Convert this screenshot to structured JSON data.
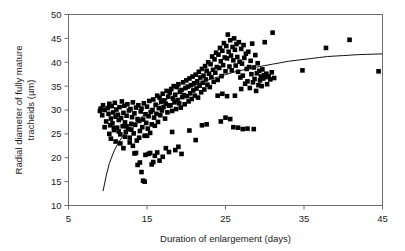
{
  "chart_data": {
    "type": "scatter",
    "title": "",
    "xlabel": "Duration of enlargement (days)",
    "ylabel": "Radial diameter of fully mature tracheids (µm)",
    "ylabel_line1": "Radial diameter of fully mature",
    "ylabel_line2": "tracheids (µm)",
    "xlim": [
      5,
      45
    ],
    "ylim": [
      10,
      50
    ],
    "xticks": [
      5,
      15,
      25,
      35,
      45
    ],
    "yticks": [
      10,
      15,
      20,
      25,
      30,
      35,
      40,
      45,
      50
    ],
    "xtick_labels": [
      "5",
      "15",
      "25",
      "35",
      "45"
    ],
    "ytick_labels": [
      "10",
      "15",
      "20",
      "25",
      "30",
      "35",
      "40",
      "45",
      "50"
    ],
    "grid": false,
    "legend": false,
    "marker": "filled-square",
    "marker_color": "#000000",
    "marker_size_px": 4.6,
    "series": [
      {
        "name": "tracheid measurements",
        "points": [
          [
            9.0,
            29.8
          ],
          [
            9.1,
            30.3
          ],
          [
            9.3,
            28.9
          ],
          [
            9.4,
            31.0
          ],
          [
            9.6,
            30.0
          ],
          [
            9.8,
            27.6
          ],
          [
            10.0,
            30.4
          ],
          [
            10.1,
            29.2
          ],
          [
            10.2,
            31.3
          ],
          [
            10.3,
            26.8
          ],
          [
            10.4,
            28.2
          ],
          [
            10.5,
            30.8
          ],
          [
            10.6,
            27.2
          ],
          [
            10.7,
            29.5
          ],
          [
            10.8,
            25.8
          ],
          [
            10.9,
            31.5
          ],
          [
            11.0,
            28.6
          ],
          [
            11.1,
            30.1
          ],
          [
            11.2,
            26.3
          ],
          [
            11.3,
            29.0
          ],
          [
            11.4,
            27.9
          ],
          [
            11.5,
            30.6
          ],
          [
            11.6,
            24.9
          ],
          [
            11.7,
            28.3
          ],
          [
            11.8,
            31.8
          ],
          [
            11.9,
            26.6
          ],
          [
            12.0,
            29.4
          ],
          [
            12.1,
            30.9
          ],
          [
            12.2,
            27.4
          ],
          [
            12.3,
            25.4
          ],
          [
            12.4,
            28.8
          ],
          [
            12.5,
            31.2
          ],
          [
            12.6,
            26.0
          ],
          [
            12.7,
            29.9
          ],
          [
            12.8,
            24.2
          ],
          [
            12.9,
            30.2
          ],
          [
            13.0,
            27.1
          ],
          [
            13.1,
            28.5
          ],
          [
            13.2,
            31.6
          ],
          [
            13.3,
            25.1
          ],
          [
            13.4,
            29.3
          ],
          [
            13.5,
            26.9
          ],
          [
            13.6,
            30.5
          ],
          [
            13.7,
            23.6
          ],
          [
            13.8,
            28.1
          ],
          [
            13.9,
            31.0
          ],
          [
            14.0,
            27.7
          ],
          [
            14.1,
            25.6
          ],
          [
            14.2,
            29.7
          ],
          [
            14.3,
            30.3
          ],
          [
            14.4,
            26.4
          ],
          [
            14.5,
            28.0
          ],
          [
            14.6,
            31.4
          ],
          [
            14.7,
            24.6
          ],
          [
            14.8,
            29.1
          ],
          [
            14.9,
            27.3
          ],
          [
            15.0,
            30.7
          ],
          [
            15.1,
            26.1
          ],
          [
            15.2,
            28.7
          ],
          [
            15.3,
            31.9
          ],
          [
            15.4,
            25.2
          ],
          [
            15.5,
            29.6
          ],
          [
            15.6,
            27.0
          ],
          [
            15.7,
            30.0
          ],
          [
            15.8,
            32.2
          ],
          [
            15.9,
            28.4
          ],
          [
            16.0,
            26.7
          ],
          [
            16.1,
            31.1
          ],
          [
            16.2,
            29.2
          ],
          [
            16.3,
            33.0
          ],
          [
            16.4,
            27.5
          ],
          [
            16.5,
            30.4
          ],
          [
            16.6,
            32.6
          ],
          [
            16.7,
            28.9
          ],
          [
            16.8,
            31.7
          ],
          [
            16.9,
            29.9
          ],
          [
            17.0,
            33.4
          ],
          [
            17.1,
            30.6
          ],
          [
            17.2,
            32.0
          ],
          [
            17.3,
            28.2
          ],
          [
            17.4,
            31.3
          ],
          [
            17.5,
            34.0
          ],
          [
            17.6,
            29.5
          ],
          [
            17.7,
            32.8
          ],
          [
            17.8,
            30.9
          ],
          [
            17.9,
            33.6
          ],
          [
            18.0,
            31.0
          ],
          [
            18.1,
            34.4
          ],
          [
            18.2,
            29.8
          ],
          [
            18.3,
            32.4
          ],
          [
            18.4,
            35.0
          ],
          [
            18.5,
            31.6
          ],
          [
            18.6,
            33.2
          ],
          [
            18.7,
            30.2
          ],
          [
            18.8,
            34.8
          ],
          [
            18.9,
            32.1
          ],
          [
            19.0,
            35.4
          ],
          [
            19.1,
            31.4
          ],
          [
            19.2,
            33.8
          ],
          [
            19.3,
            30.5
          ],
          [
            19.4,
            34.2
          ],
          [
            19.5,
            32.7
          ],
          [
            19.6,
            35.8
          ],
          [
            19.7,
            33.1
          ],
          [
            19.8,
            31.2
          ],
          [
            19.9,
            34.6
          ],
          [
            20.0,
            36.2
          ],
          [
            20.1,
            32.9
          ],
          [
            20.2,
            34.9
          ],
          [
            20.3,
            31.8
          ],
          [
            20.4,
            36.6
          ],
          [
            20.5,
            33.5
          ],
          [
            20.6,
            35.2
          ],
          [
            20.7,
            32.3
          ],
          [
            20.8,
            37.0
          ],
          [
            20.9,
            34.1
          ],
          [
            21.0,
            35.6
          ],
          [
            21.1,
            33.0
          ],
          [
            21.2,
            37.4
          ],
          [
            21.3,
            34.5
          ],
          [
            21.4,
            36.0
          ],
          [
            21.5,
            32.6
          ],
          [
            21.6,
            38.0
          ],
          [
            21.7,
            35.1
          ],
          [
            21.8,
            36.8
          ],
          [
            21.9,
            33.7
          ],
          [
            22.0,
            38.6
          ],
          [
            22.1,
            35.7
          ],
          [
            22.2,
            37.2
          ],
          [
            22.3,
            34.3
          ],
          [
            22.4,
            39.2
          ],
          [
            22.5,
            36.4
          ],
          [
            22.6,
            38.2
          ],
          [
            22.7,
            35.3
          ],
          [
            22.8,
            40.0
          ],
          [
            22.9,
            37.6
          ],
          [
            23.0,
            34.8
          ],
          [
            23.1,
            39.6
          ],
          [
            23.2,
            36.9
          ],
          [
            23.3,
            41.2
          ],
          [
            23.4,
            38.4
          ],
          [
            23.5,
            35.9
          ],
          [
            23.6,
            40.6
          ],
          [
            23.7,
            37.8
          ],
          [
            23.8,
            42.0
          ],
          [
            23.9,
            39.0
          ],
          [
            24.0,
            36.3
          ],
          [
            24.1,
            41.6
          ],
          [
            24.2,
            38.8
          ],
          [
            24.3,
            43.0
          ],
          [
            24.4,
            40.2
          ],
          [
            24.5,
            37.1
          ],
          [
            24.6,
            42.4
          ],
          [
            24.7,
            39.4
          ],
          [
            24.8,
            44.0
          ],
          [
            24.9,
            41.0
          ],
          [
            25.0,
            38.1
          ],
          [
            25.1,
            43.4
          ],
          [
            25.2,
            40.8
          ],
          [
            25.3,
            45.8
          ],
          [
            25.4,
            42.2
          ],
          [
            25.5,
            39.1
          ],
          [
            25.6,
            44.6
          ],
          [
            25.7,
            41.4
          ],
          [
            25.8,
            38.3
          ],
          [
            25.9,
            43.2
          ],
          [
            26.0,
            40.4
          ],
          [
            26.1,
            45.0
          ],
          [
            26.2,
            42.6
          ],
          [
            26.3,
            39.3
          ],
          [
            26.4,
            43.8
          ],
          [
            26.5,
            41.1
          ],
          [
            26.6,
            38.0
          ],
          [
            26.7,
            44.2
          ],
          [
            26.8,
            40.1
          ],
          [
            26.9,
            36.8
          ],
          [
            27.0,
            42.8
          ],
          [
            27.1,
            39.7
          ],
          [
            27.2,
            37.2
          ],
          [
            27.3,
            43.6
          ],
          [
            27.4,
            40.9
          ],
          [
            27.5,
            35.5
          ],
          [
            27.6,
            41.8
          ],
          [
            27.7,
            38.6
          ],
          [
            27.8,
            36.0
          ],
          [
            27.9,
            42.2
          ],
          [
            28.0,
            39.0
          ],
          [
            28.1,
            34.6
          ],
          [
            28.2,
            40.3
          ],
          [
            28.3,
            37.5
          ],
          [
            28.4,
            43.9
          ],
          [
            28.5,
            35.8
          ],
          [
            28.6,
            38.9
          ],
          [
            28.7,
            36.5
          ],
          [
            28.8,
            41.5
          ],
          [
            28.9,
            34.0
          ],
          [
            29.0,
            37.7
          ],
          [
            29.1,
            39.8
          ],
          [
            29.2,
            35.2
          ],
          [
            29.3,
            38.2
          ],
          [
            29.4,
            36.2
          ],
          [
            29.5,
            37.0
          ],
          [
            29.6,
            35.0
          ],
          [
            29.7,
            38.5
          ],
          [
            29.8,
            36.6
          ],
          [
            29.9,
            37.3
          ],
          [
            30.0,
            44.2
          ],
          [
            30.1,
            36.9
          ],
          [
            30.2,
            37.6
          ],
          [
            30.3,
            35.4
          ],
          [
            30.5,
            37.1
          ],
          [
            30.7,
            36.4
          ],
          [
            30.9,
            37.9
          ],
          [
            31.0,
            46.2
          ],
          [
            31.2,
            36.7
          ],
          [
            12.0,
            22.0
          ],
          [
            13.2,
            22.5
          ],
          [
            13.4,
            20.9
          ],
          [
            13.6,
            21.0
          ],
          [
            13.8,
            18.5
          ],
          [
            14.0,
            24.2
          ],
          [
            14.1,
            19.0
          ],
          [
            14.3,
            17.0
          ],
          [
            14.5,
            15.2
          ],
          [
            14.7,
            15.0
          ],
          [
            14.8,
            20.6
          ],
          [
            15.0,
            24.6
          ],
          [
            15.2,
            20.8
          ],
          [
            15.4,
            21.0
          ],
          [
            15.6,
            18.6
          ],
          [
            15.8,
            19.1
          ],
          [
            16.0,
            20.4
          ],
          [
            16.3,
            21.1
          ],
          [
            16.6,
            19.4
          ],
          [
            17.0,
            20.2
          ],
          [
            17.4,
            22.0
          ],
          [
            17.8,
            21.2
          ],
          [
            18.2,
            25.4
          ],
          [
            18.6,
            21.6
          ],
          [
            19.0,
            22.3
          ],
          [
            19.4,
            20.8
          ],
          [
            20.4,
            25.7
          ],
          [
            21.2,
            23.7
          ],
          [
            22.0,
            26.8
          ],
          [
            22.6,
            27.0
          ],
          [
            24.4,
            27.6
          ],
          [
            25.0,
            28.4
          ],
          [
            25.6,
            28.1
          ],
          [
            26.0,
            26.4
          ],
          [
            26.6,
            26.3
          ],
          [
            27.2,
            26.0
          ],
          [
            27.8,
            26.1
          ],
          [
            28.6,
            26.0
          ],
          [
            24.0,
            33.0
          ],
          [
            24.6,
            33.4
          ],
          [
            25.2,
            32.9
          ],
          [
            26.2,
            33.0
          ],
          [
            27.0,
            34.4
          ],
          [
            10.4,
            24.0
          ],
          [
            11.0,
            23.4
          ],
          [
            11.6,
            23.0
          ],
          [
            12.2,
            24.4
          ],
          [
            12.8,
            23.2
          ],
          [
            9.6,
            26.4
          ],
          [
            10.2,
            25.0
          ],
          [
            10.8,
            26.2
          ],
          [
            11.4,
            25.5
          ],
          [
            12.4,
            26.6
          ],
          [
            13.0,
            25.9
          ],
          [
            34.8,
            38.3
          ],
          [
            37.8,
            43.0
          ],
          [
            40.8,
            44.7
          ],
          [
            44.5,
            38.1
          ]
        ]
      }
    ],
    "fit_curve": {
      "name": "fitted trend",
      "color": "#111111",
      "points": [
        [
          9.4,
          13.0
        ],
        [
          9.8,
          16.2
        ],
        [
          10.2,
          18.8
        ],
        [
          10.8,
          21.4
        ],
        [
          11.4,
          23.3
        ],
        [
          12.0,
          24.7
        ],
        [
          13.0,
          26.6
        ],
        [
          14.0,
          28.1
        ],
        [
          15.0,
          29.4
        ],
        [
          16.0,
          30.6
        ],
        [
          17.0,
          31.7
        ],
        [
          18.0,
          32.7
        ],
        [
          19.0,
          33.6
        ],
        [
          20.0,
          34.4
        ],
        [
          21.0,
          35.1
        ],
        [
          22.0,
          35.8
        ],
        [
          23.0,
          36.4
        ],
        [
          24.0,
          36.9
        ],
        [
          25.0,
          37.4
        ],
        [
          26.0,
          37.9
        ],
        [
          27.0,
          38.3
        ],
        [
          28.0,
          38.7
        ],
        [
          29.0,
          39.0
        ],
        [
          30.0,
          39.3
        ],
        [
          31.0,
          39.6
        ],
        [
          32.0,
          39.9
        ],
        [
          33.0,
          40.2
        ],
        [
          34.0,
          40.4
        ],
        [
          35.0,
          40.6
        ],
        [
          36.0,
          40.8
        ],
        [
          37.0,
          41.0
        ],
        [
          38.0,
          41.2
        ],
        [
          39.0,
          41.3
        ],
        [
          40.0,
          41.4
        ],
        [
          41.0,
          41.5
        ],
        [
          42.0,
          41.6
        ],
        [
          43.0,
          41.65
        ],
        [
          44.0,
          41.7
        ],
        [
          45.0,
          41.75
        ]
      ]
    }
  }
}
